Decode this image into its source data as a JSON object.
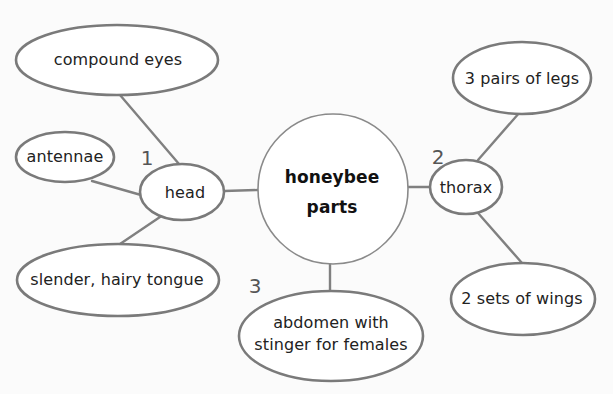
{
  "diagram": {
    "type": "concept-web",
    "colors": {
      "background": "#fbfbfb",
      "stroke": "#7a7a7a",
      "text": "#222222",
      "number": "#555555"
    },
    "center": {
      "label_line1": "honeybee",
      "label_line2": "parts"
    },
    "parts": [
      {
        "number": "1",
        "label": "head",
        "details": [
          "compound eyes",
          "antennae",
          "slender, hairy tongue"
        ]
      },
      {
        "number": "2",
        "label": "thorax",
        "details": [
          "3 pairs of legs",
          "2 sets of wings"
        ]
      },
      {
        "number": "3",
        "label_line1": "abdomen with",
        "label_line2": "stinger for females",
        "details": []
      }
    ]
  }
}
